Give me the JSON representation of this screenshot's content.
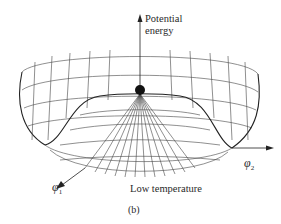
{
  "figure": {
    "y_axis_label_line1": "Potential",
    "y_axis_label_line2": "energy",
    "axis_x1_symbol": "φ",
    "axis_x1_subscript": "1",
    "axis_x2_symbol": "φ",
    "axis_x2_subscript": "2",
    "condition_label": "Low temperature",
    "panel_label": "(b)",
    "surface": "Mexican-hat (double-well) potential energy surface drawn as a wireframe",
    "ball": "Black ball resting at unstable maximum on top of central hump",
    "colors": {
      "line": "#333333",
      "ball": "#111111",
      "background": "#ffffff"
    }
  }
}
